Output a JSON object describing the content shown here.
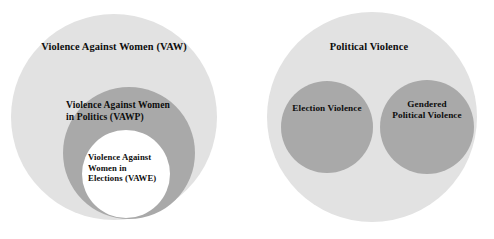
{
  "figure": {
    "type": "venn-diagram-pair",
    "background_color": "#ffffff",
    "colors": {
      "outer_circle_fill": "#e2e2e2",
      "inner_circle_fill": "#a9a9a9",
      "innermost_circle_fill": "#ffffff",
      "label_text": "#0d0d0d"
    }
  },
  "left_diagram": {
    "name": "violence-against-women-nesting",
    "outer": {
      "label": "Violence Against Women (VAW)",
      "fill": "#e2e2e2",
      "cx": 114,
      "cy": 117,
      "r": 103
    },
    "middle": {
      "label": "Violence Against Women\nin Politics (VAWP)",
      "fill": "#a9a9a9",
      "cx": 129,
      "cy": 153,
      "r": 66
    },
    "inner": {
      "label": "Violence Against\nWomen in\nElections (VAWE)",
      "fill": "#ffffff",
      "cx": 126,
      "cy": 174,
      "r": 44
    }
  },
  "right_diagram": {
    "name": "political-violence-subsets",
    "outer": {
      "label": "Political Violence",
      "fill": "#e2e2e2",
      "cx": 372,
      "cy": 117,
      "r": 105
    },
    "subsets": [
      {
        "label": "Election Violence",
        "fill": "#a9a9a9",
        "cx": 327,
        "cy": 127,
        "r": 46
      },
      {
        "label": "Gendered\nPolitical Violence",
        "fill": "#a9a9a9",
        "cx": 427,
        "cy": 127,
        "r": 47
      }
    ]
  },
  "chart_data": {
    "type": "diagram",
    "title": "",
    "diagram_style": "nested and disjoint set (Euler) diagrams",
    "panels": [
      {
        "panel": "left",
        "relationship": "strictly nested subsets",
        "sets": [
          {
            "level": 0,
            "name": "Violence Against Women (VAW)",
            "shade": "light gray"
          },
          {
            "level": 1,
            "name": "Violence Against Women in Politics (VAWP)",
            "shade": "medium gray"
          },
          {
            "level": 2,
            "name": "Violence Against Women in Elections (VAWE)",
            "shade": "white"
          }
        ]
      },
      {
        "panel": "right",
        "relationship": "two disjoint subsets within one superset",
        "sets": [
          {
            "level": 0,
            "name": "Political Violence",
            "shade": "light gray"
          },
          {
            "level": 1,
            "name": "Election Violence",
            "shade": "medium gray"
          },
          {
            "level": 1,
            "name": "Gendered Political Violence",
            "shade": "medium gray"
          }
        ]
      }
    ]
  }
}
